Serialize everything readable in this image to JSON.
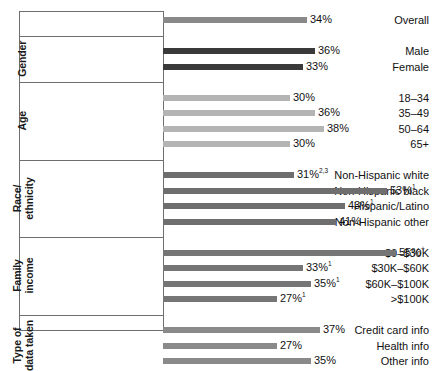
{
  "chart_data": {
    "type": "bar",
    "orientation": "horizontal",
    "title": "",
    "xlabel": "",
    "ylabel": "",
    "xlim": [
      0,
      60
    ],
    "grid": false,
    "legend": "none",
    "value_suffix": "%",
    "groups": [
      {
        "name": "",
        "color": "#898989",
        "categories": [
          "Overall"
        ],
        "values": [
          34
        ],
        "labels": [
          "34%"
        ],
        "notes": [
          ""
        ]
      },
      {
        "name": "Gender",
        "name_lines": [
          "Gender"
        ],
        "color": "#3a3a3a",
        "categories": [
          "Male",
          "Female"
        ],
        "values": [
          36,
          33
        ],
        "labels": [
          "36%",
          "33%"
        ],
        "notes": [
          "",
          ""
        ]
      },
      {
        "name": "Age",
        "name_lines": [
          "Age"
        ],
        "color": "#b4b4b4",
        "categories": [
          "18–34",
          "35–49",
          "50–64",
          "65+"
        ],
        "values": [
          30,
          36,
          38,
          30
        ],
        "labels": [
          "30%",
          "36%",
          "38%",
          "30%"
        ],
        "notes": [
          "",
          "",
          "",
          ""
        ]
      },
      {
        "name": "Race/ethnicity",
        "name_lines": [
          "Race/",
          "ethnicity"
        ],
        "color": "#6e6e6e",
        "categories": [
          "Non-Hispanic white",
          "Non-Hispanic black",
          "Hispanic/Latino",
          "Non-Hispanic other"
        ],
        "values": [
          31,
          53,
          43,
          41
        ],
        "labels": [
          "31%",
          "53%",
          "43%",
          "41%"
        ],
        "notes": [
          "2,3",
          "1",
          "1",
          ""
        ]
      },
      {
        "name": "Family income",
        "name_lines": [
          "Family",
          "income"
        ],
        "color": "#767676",
        "categories": [
          "$0–$30K",
          "$30K–$60K",
          "$60K–$100K",
          ">$100K"
        ],
        "values": [
          55,
          33,
          35,
          27
        ],
        "labels": [
          "55%",
          "33%",
          "35%",
          "27%"
        ],
        "notes": [
          "+",
          "1",
          "1",
          "1"
        ]
      },
      {
        "name": "Type of data taken",
        "name_lines": [
          "Type of",
          "data taken"
        ],
        "color": "#8a8a8a",
        "categories": [
          "Credit card info",
          "Health info",
          "Other info"
        ],
        "values": [
          37,
          27,
          35
        ],
        "labels": [
          "37%",
          "27%",
          "35%"
        ],
        "notes": [
          "",
          "",
          ""
        ]
      }
    ]
  }
}
